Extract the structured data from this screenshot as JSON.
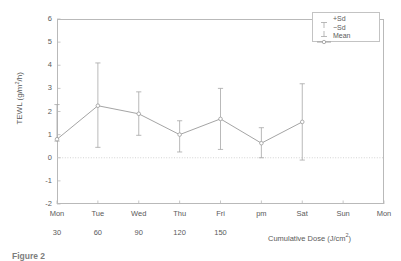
{
  "figure": {
    "caption": "Figure 2"
  },
  "chart_data": {
    "type": "line",
    "title": "",
    "xlabel": "Cumulative Dose (J/cm2)",
    "ylabel": "TEWL (g/m2/h)",
    "ylim": [
      -2,
      6
    ],
    "yticks": [
      6,
      5,
      4,
      3,
      2,
      1,
      0,
      -1,
      -2
    ],
    "grid": false,
    "zero_reference_line": 0,
    "legend_position": "top-right",
    "x_categories": [
      "Mon",
      "Tue",
      "Wed",
      "Thu",
      "Fri",
      "pm",
      "Sat",
      "Sun",
      "Mon"
    ],
    "dose_labels": [
      "30",
      "60",
      "90",
      "120",
      "150",
      "",
      "",
      "",
      ""
    ],
    "series": [
      {
        "name": "Mean",
        "points": [
          {
            "x": "Mon",
            "dose": "30",
            "mean": 0.8,
            "plus_sd": 2.3,
            "minus_sd": 0.72
          },
          {
            "x": "Tue",
            "dose": "60",
            "mean": 2.25,
            "plus_sd": 4.1,
            "minus_sd": 0.45
          },
          {
            "x": "Wed",
            "dose": "90",
            "mean": 1.9,
            "plus_sd": 2.85,
            "minus_sd": 0.97
          },
          {
            "x": "Thu",
            "dose": "120",
            "mean": 1.0,
            "plus_sd": 1.6,
            "minus_sd": 0.25
          },
          {
            "x": "Fri",
            "dose": "150",
            "mean": 1.68,
            "plus_sd": 3.0,
            "minus_sd": 0.36
          },
          {
            "x": "pm",
            "dose": "",
            "mean": 0.63,
            "plus_sd": 1.3,
            "minus_sd": 0.0
          },
          {
            "x": "Mon",
            "dose": "",
            "mean": 1.55,
            "plus_sd": 3.2,
            "minus_sd": -0.1
          }
        ]
      }
    ],
    "legend": [
      {
        "key": "plus-sd",
        "label": "+Sd"
      },
      {
        "key": "minus-sd",
        "label": "−Sd"
      },
      {
        "key": "mean",
        "label": "Mean"
      }
    ]
  },
  "axis": {
    "ytick_labels": [
      "6",
      "5",
      "4",
      "3",
      "2",
      "1",
      "0",
      "-1",
      "-2"
    ],
    "xtick_labels": [
      "Mon",
      "Tue",
      "Wed",
      "Thu",
      "Fri",
      "pm",
      "Sat",
      "Sun",
      "Mon"
    ],
    "dose_row": [
      "30",
      "60",
      "90",
      "120",
      "150"
    ],
    "xaxis_title_main": "Cumulative Dose (J/cm",
    "xaxis_title_sup": "2",
    "xaxis_title_end": ")",
    "yaxis_title_a": "TEWL  (g/m",
    "yaxis_title_sup": "2",
    "yaxis_title_b": "/h)"
  },
  "colors": {
    "line": "#9a9a9a",
    "frame": "#b9b9b9",
    "text": "#5a5a5a",
    "zero_line": "#c8c8c8"
  }
}
